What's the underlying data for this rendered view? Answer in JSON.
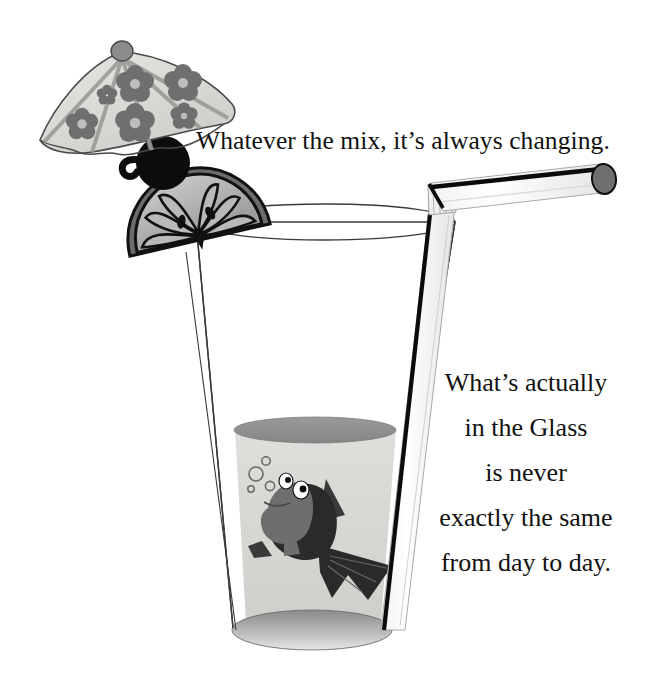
{
  "canvas": {
    "width": 662,
    "height": 677,
    "background": "#ffffff"
  },
  "headline": {
    "text": "Whatever the mix, it’s always changing."
  },
  "caption": {
    "lines": [
      "What’s actually",
      "in the Glass",
      "is never",
      "exactly the same",
      "from day to day."
    ]
  },
  "illustration": {
    "title": "cocktail-glass-with-fish",
    "objects": [
      "paper-umbrella",
      "cherry-garnish",
      "citrus-slice",
      "drinking-glass",
      "liquid",
      "bendy-straw",
      "cartoon-fish",
      "bubbles"
    ],
    "colors": {
      "ink": "#111111",
      "outline": "#2b2b2b",
      "umbrella_canopy": "#d9d9d6",
      "umbrella_flower": "#6f6f6f",
      "umbrella_rib": "#9a9a97",
      "umbrella_knob": "#8c8c8c",
      "cherry": "#0c0c0c",
      "citrus_rind": "#6b6b6b",
      "citrus_flesh": "#b9b9b9",
      "citrus_vein": "#141414",
      "glass_outline": "#3a3a3a",
      "glass_body": "#ffffff",
      "liquid_surface": "#8f8f8f",
      "liquid_body": "#d8d8d5",
      "glass_base": "#9e9e9e",
      "straw_body": "#fbfbfb",
      "straw_stripe": "#0b0b0b",
      "straw_opening": "#707070",
      "fish_head": "#6e6e6e",
      "fish_body": "#2a2a2a",
      "fish_eye_white": "#ffffff",
      "fish_pupil": "#0b0b0b",
      "bubble_outline": "#6a6a6a"
    }
  }
}
